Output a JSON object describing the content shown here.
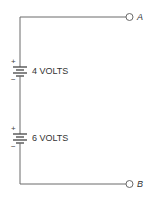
{
  "diagram": {
    "type": "circuit-schematic",
    "colors": {
      "wire": "#6a6a6a",
      "text": "#333333",
      "background": "#ffffff"
    },
    "batteries": [
      {
        "label": "4 VOLTS",
        "positive_sign": "+",
        "negative_sign": "−"
      },
      {
        "label": "6 VOLTS",
        "positive_sign": "+",
        "negative_sign": "−"
      }
    ],
    "terminals": [
      {
        "label": "A"
      },
      {
        "label": "B"
      }
    ]
  }
}
